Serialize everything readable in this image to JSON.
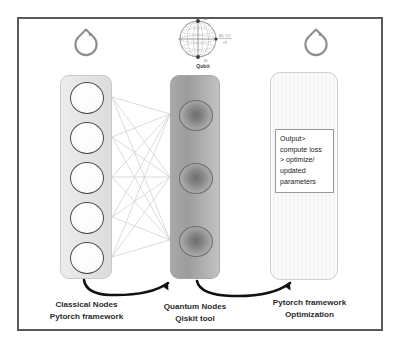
{
  "diagram": {
    "frame_color": "#595959",
    "background": "#ffffff"
  },
  "logos": {
    "left": {
      "name": "pytorch-logo",
      "alt": "PyTorch flame logo",
      "color": "#8d8d8d"
    },
    "right": {
      "name": "pytorch-logo",
      "alt": "PyTorch flame logo",
      "color": "#8d8d8d"
    }
  },
  "bloch": {
    "label": "Qubit",
    "top_state": "|0⟩",
    "bottom_state": "|1⟩",
    "superposition_numerator": "|0⟩ + |1⟩",
    "superposition_denominator": "√2",
    "color": "#6f6f6f"
  },
  "columns": {
    "classical": {
      "caption_line1": "Classical Nodes",
      "caption_line2": "Pytorch framework",
      "node_count": 5,
      "fill": "#e7e7e7",
      "node_fill": "#fdfdfd",
      "node_border": "#4a4a4a"
    },
    "quantum": {
      "caption_line1": "Quantum Nodes",
      "caption_line2": "Qiskit tool",
      "node_count": 3,
      "fill": "#a5a5a5",
      "node_fill": "#7a7a7a",
      "node_border": "#6e6e6e"
    },
    "output": {
      "caption_line1": "Pytorch framework",
      "caption_line2": "Optimization",
      "fill": "#f8f8f8",
      "border": "#cfcfcf"
    }
  },
  "output_box": {
    "lines": [
      "Output>",
      "compute loss",
      "> optimize/",
      "updated",
      "parameters"
    ],
    "border": "#9a9a9a",
    "text_color": "#1d1d1d"
  },
  "connections": {
    "description": "fully connected edges from 5 classical nodes to 3 quantum nodes",
    "from_count": 5,
    "to_count": 3,
    "edge_count": 15,
    "color": "#cbcbcb"
  },
  "arrows": [
    {
      "name": "classical-to-quantum",
      "color": "#111111"
    },
    {
      "name": "quantum-to-output",
      "color": "#111111"
    }
  ]
}
